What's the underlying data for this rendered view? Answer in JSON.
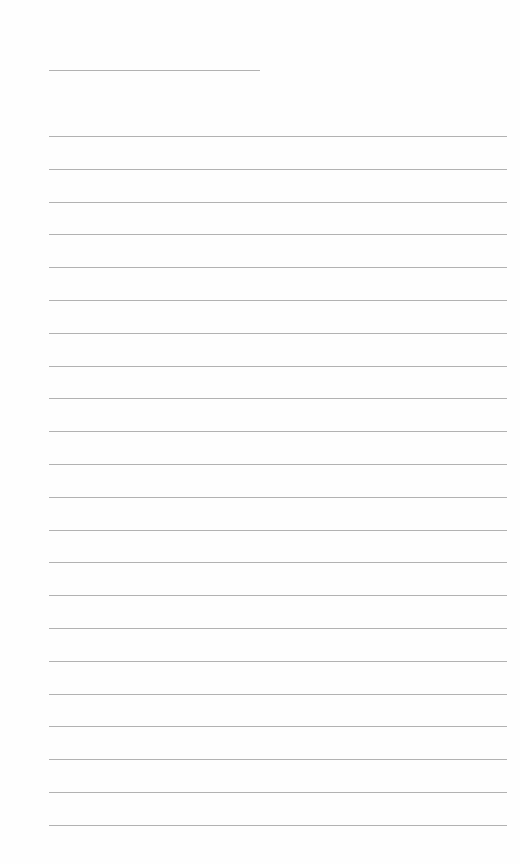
{
  "page": {
    "type": "blank-lined-sheet",
    "background": "#fefefe",
    "line_color": "#b2b2b2"
  },
  "title_line": {
    "x": 49,
    "y": 70,
    "width": 211
  },
  "writing_lines": {
    "count": 22,
    "x": 49,
    "width": 458,
    "first_y": 136,
    "spacing": 32.8
  }
}
